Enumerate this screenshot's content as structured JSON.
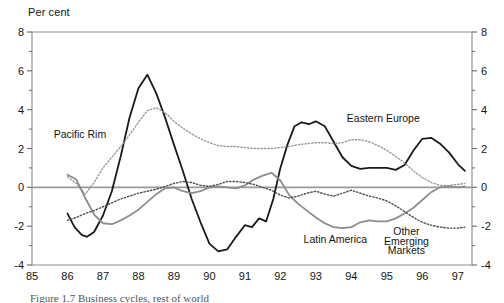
{
  "figure": {
    "axis_title": "Per cent",
    "caption": "Figure 1.7   Business cycles, rest of world"
  },
  "chart_data": {
    "type": "line",
    "title": "",
    "subtitle": "",
    "xlabel": "",
    "ylabel": "Per cent",
    "grid": false,
    "legend_position": "inline-annotations",
    "xlim": [
      85,
      97.4
    ],
    "ylim": [
      -4,
      8
    ],
    "ytick_labels": [
      "8",
      "6",
      "4",
      "2",
      "0",
      "-2",
      "-4"
    ],
    "ytick_values": [
      8,
      6,
      4,
      2,
      0,
      -2,
      -4
    ],
    "yminor_step": 1,
    "y_axes_sides": [
      "left",
      "right"
    ],
    "xtick_labels": [
      "85",
      "86",
      "87",
      "88",
      "89",
      "90",
      "91",
      "92",
      "93",
      "94",
      "95",
      "96",
      "97"
    ],
    "xtick_values": [
      85,
      86,
      87,
      88,
      89,
      90,
      91,
      92,
      93,
      94,
      95,
      96,
      97
    ],
    "zero_line": 0,
    "series": [
      {
        "name": "Eastern Europe",
        "style": "solid",
        "color": "#1a1a1a",
        "width": 1.8,
        "label_x": 94.9,
        "label_y": 3.35,
        "x": [
          86.0,
          86.2,
          86.4,
          86.55,
          86.75,
          87.0,
          87.25,
          87.5,
          87.75,
          88.0,
          88.25,
          88.5,
          88.75,
          89.0,
          89.25,
          89.5,
          89.75,
          90.0,
          90.25,
          90.5,
          90.75,
          91.0,
          91.2,
          91.4,
          91.6,
          91.8,
          92.0,
          92.2,
          92.4,
          92.6,
          92.8,
          93.0,
          93.25,
          93.5,
          93.75,
          94.0,
          94.25,
          94.5,
          94.75,
          95.0,
          95.25,
          95.5,
          95.75,
          96.0,
          96.25,
          96.5,
          96.75,
          97.0,
          97.2
        ],
        "values": [
          -1.35,
          -2.05,
          -2.45,
          -2.55,
          -2.3,
          -1.45,
          -0.2,
          1.6,
          3.6,
          5.1,
          5.8,
          4.85,
          3.6,
          2.2,
          0.85,
          -0.6,
          -1.8,
          -2.9,
          -3.3,
          -3.2,
          -2.55,
          -1.95,
          -2.05,
          -1.6,
          -1.75,
          -0.6,
          1.0,
          2.2,
          3.15,
          3.35,
          3.25,
          3.4,
          3.15,
          2.35,
          1.55,
          1.1,
          0.95,
          1.0,
          1.0,
          1.0,
          0.9,
          1.15,
          1.9,
          2.5,
          2.55,
          2.25,
          1.8,
          1.2,
          0.85
        ]
      },
      {
        "name": "Pacific Rim",
        "style": "dotted",
        "color": "#9a9a9a",
        "width": 1.4,
        "label_x": 86.35,
        "label_y": 2.55,
        "x": [
          86.0,
          86.25,
          86.5,
          86.75,
          87.0,
          87.25,
          87.5,
          87.75,
          88.0,
          88.25,
          88.5,
          88.75,
          89.0,
          89.25,
          89.5,
          89.75,
          90.0,
          90.25,
          90.5,
          90.75,
          91.0,
          91.25,
          91.5,
          91.75,
          92.0,
          92.25,
          92.5,
          92.75,
          93.0,
          93.25,
          93.5,
          93.75,
          94.0,
          94.25,
          94.5,
          94.75,
          95.0,
          95.25,
          95.5,
          95.75,
          96.0,
          96.25,
          96.5,
          96.75,
          97.0,
          97.2
        ],
        "values": [
          0.55,
          0.2,
          -0.35,
          0.25,
          1.0,
          1.55,
          2.1,
          2.7,
          3.35,
          3.95,
          4.1,
          3.85,
          3.4,
          3.05,
          2.75,
          2.5,
          2.3,
          2.15,
          2.1,
          2.1,
          2.05,
          2.0,
          2.0,
          2.0,
          2.05,
          2.1,
          2.2,
          2.25,
          2.3,
          2.3,
          2.25,
          2.3,
          2.45,
          2.45,
          2.35,
          2.15,
          1.9,
          1.6,
          1.25,
          0.85,
          0.5,
          0.25,
          0.1,
          0.1,
          0.15,
          0.2
        ]
      },
      {
        "name": "Latin America",
        "style": "solid",
        "color": "#8d8d8d",
        "width": 1.8,
        "label_x": 93.55,
        "label_y": -2.85,
        "x": [
          86.0,
          86.25,
          86.5,
          86.75,
          87.0,
          87.25,
          87.5,
          87.75,
          88.0,
          88.25,
          88.5,
          88.75,
          89.0,
          89.25,
          89.5,
          89.75,
          90.0,
          90.25,
          90.5,
          90.75,
          91.0,
          91.25,
          91.5,
          91.75,
          92.0,
          92.25,
          92.5,
          92.75,
          93.0,
          93.25,
          93.5,
          93.75,
          94.0,
          94.25,
          94.5,
          94.75,
          95.0,
          95.25,
          95.5,
          95.75,
          96.0,
          96.25,
          96.5,
          96.75,
          97.0,
          97.2
        ],
        "values": [
          0.65,
          0.4,
          -0.55,
          -1.4,
          -1.85,
          -1.9,
          -1.7,
          -1.45,
          -1.15,
          -0.75,
          -0.35,
          -0.05,
          0.0,
          -0.2,
          -0.3,
          -0.2,
          0.0,
          0.05,
          0.0,
          -0.05,
          0.1,
          0.4,
          0.6,
          0.75,
          0.35,
          -0.4,
          -0.85,
          -1.2,
          -1.55,
          -1.85,
          -2.05,
          -2.1,
          -2.05,
          -1.8,
          -1.7,
          -1.75,
          -1.75,
          -1.6,
          -1.35,
          -1.05,
          -0.65,
          -0.25,
          0.0,
          0.05,
          0.0,
          0.05
        ]
      },
      {
        "name": "Other Emerging Markets",
        "style": "dotted",
        "color": "#4f4f4f",
        "width": 1.4,
        "label_x": 95.55,
        "label_y": -2.45,
        "x": [
          86.0,
          86.25,
          86.5,
          86.75,
          87.0,
          87.25,
          87.5,
          87.75,
          88.0,
          88.25,
          88.5,
          88.75,
          89.0,
          89.25,
          89.5,
          89.75,
          90.0,
          90.25,
          90.5,
          90.75,
          91.0,
          91.25,
          91.5,
          91.75,
          92.0,
          92.25,
          92.5,
          92.75,
          93.0,
          93.25,
          93.5,
          93.75,
          94.0,
          94.25,
          94.5,
          94.75,
          95.0,
          95.25,
          95.5,
          95.75,
          96.0,
          96.25,
          96.5,
          96.75,
          97.0,
          97.2
        ],
        "values": [
          -1.7,
          -1.55,
          -1.35,
          -1.2,
          -1.0,
          -0.8,
          -0.6,
          -0.45,
          -0.3,
          -0.2,
          -0.1,
          0.05,
          0.2,
          0.3,
          0.25,
          0.1,
          0.05,
          0.15,
          0.3,
          0.3,
          0.25,
          0.15,
          0.0,
          -0.15,
          -0.4,
          -0.55,
          -0.45,
          -0.3,
          -0.2,
          -0.35,
          -0.45,
          -0.3,
          -0.15,
          -0.3,
          -0.45,
          -0.55,
          -0.7,
          -0.95,
          -1.25,
          -1.55,
          -1.8,
          -1.95,
          -2.05,
          -2.1,
          -2.1,
          -2.05
        ]
      }
    ],
    "annotations": [
      {
        "text": "Pacific Rim",
        "x": 86.35,
        "y": 2.55
      },
      {
        "text": "Eastern Europe",
        "x": 94.9,
        "y": 3.35
      },
      {
        "text": "Latin America",
        "x": 93.55,
        "y": -2.85
      },
      {
        "text": "Other",
        "x": 95.55,
        "y": -2.45
      },
      {
        "text": "Emerging",
        "x": 95.55,
        "y": -2.95
      },
      {
        "text": "Markets",
        "x": 95.55,
        "y": -3.45
      }
    ]
  }
}
